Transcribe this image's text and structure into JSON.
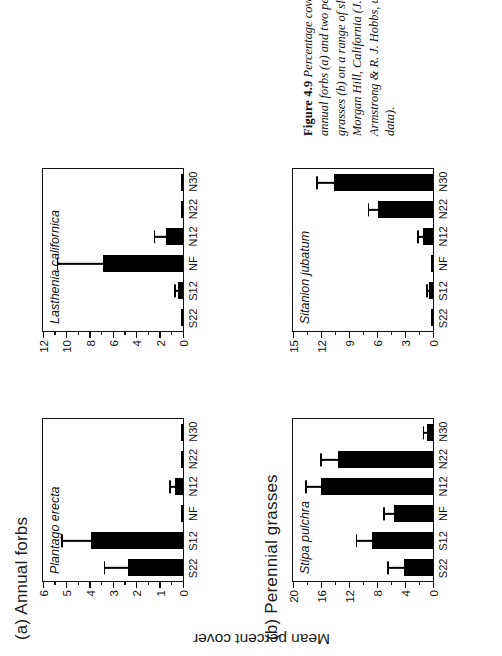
{
  "figure": {
    "number_label": "Figure 4.9",
    "caption_text": "Percentage cover of two annual forbs (a) and two perennial grasses (b) on a range of slopes at Morgan Hill, California (J. K. Armstrong & R. J. Hobbs, unpublished data).",
    "y_axis_title": "Mean percent cover"
  },
  "sections": [
    {
      "id": "a",
      "title": "(a) Annual forbs"
    },
    {
      "id": "b",
      "title": "(b) Perennial grasses"
    }
  ],
  "chart_data": [
    {
      "type": "bar",
      "title": "Plantago erecta",
      "panel": "(a) Annual forbs",
      "xlabel": "",
      "ylabel": "Mean percent cover",
      "categories": [
        "S22",
        "S12",
        "NF",
        "N12",
        "N22",
        "N30"
      ],
      "values": [
        2.4,
        4.0,
        0.0,
        0.35,
        0.0,
        0.0
      ],
      "errors": [
        1.05,
        1.3,
        0.0,
        0.25,
        0.0,
        0.0
      ],
      "ylim": [
        0,
        6
      ],
      "yticks": [
        0,
        1,
        2,
        3,
        4,
        5,
        6
      ],
      "ytick_labels": [
        "0",
        "1",
        "2",
        "3",
        "4",
        "5",
        "6"
      ],
      "grid": false,
      "legend": false
    },
    {
      "type": "bar",
      "title": "Lasthenia californica",
      "panel": "(a) Annual forbs",
      "xlabel": "",
      "ylabel": "Mean percent cover",
      "categories": [
        "S22",
        "S12",
        "NF",
        "N12",
        "N22",
        "N30"
      ],
      "values": [
        0.0,
        0.45,
        7.0,
        1.5,
        0.0,
        0.0
      ],
      "errors": [
        0.0,
        0.35,
        4.0,
        1.05,
        0.0,
        0.0
      ],
      "ylim": [
        0,
        12
      ],
      "yticks": [
        0,
        2,
        4,
        6,
        8,
        10,
        12
      ],
      "ytick_labels": [
        "0",
        "2",
        "4",
        "6",
        "8",
        "10",
        "12"
      ],
      "grid": false,
      "legend": false
    },
    {
      "type": "bar",
      "title": "Stipa pulchra",
      "panel": "(b) Perennial grasses",
      "xlabel": "",
      "ylabel": "Mean percent cover",
      "categories": [
        "S22",
        "S12",
        "NF",
        "N12",
        "N22",
        "N30"
      ],
      "values": [
        4.2,
        8.8,
        5.6,
        16.3,
        13.8,
        0.9
      ],
      "errors": [
        2.4,
        2.4,
        1.6,
        2.2,
        2.6,
        0.6
      ],
      "ylim": [
        0,
        20
      ],
      "yticks": [
        0,
        4,
        8,
        12,
        16,
        20
      ],
      "ytick_labels": [
        "0",
        "4",
        "8",
        "12",
        "16",
        "20"
      ],
      "grid": false,
      "legend": false
    },
    {
      "type": "bar",
      "title": "Sitanion jubatum",
      "panel": "(b) Perennial grasses",
      "xlabel": "",
      "ylabel": "Mean percent cover",
      "categories": [
        "S22",
        "S12",
        "NF",
        "N12",
        "N22",
        "N30"
      ],
      "values": [
        0.0,
        0.4,
        0.0,
        1.1,
        6.0,
        10.8
      ],
      "errors": [
        0.0,
        0.35,
        0.0,
        0.6,
        1.1,
        1.9
      ],
      "ylim": [
        0,
        15
      ],
      "yticks": [
        0,
        3,
        6,
        9,
        12,
        15
      ],
      "ytick_labels": [
        "0",
        "3",
        "6",
        "9",
        "12",
        "15"
      ],
      "grid": false,
      "legend": false
    }
  ]
}
